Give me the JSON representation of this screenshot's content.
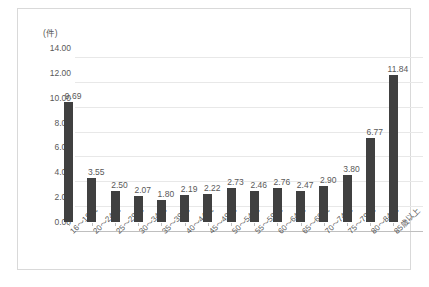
{
  "chart_data": {
    "type": "bar",
    "title": "",
    "subtitle": "",
    "xlabel": "",
    "ylabel": "(件)",
    "unit_label": "(件)",
    "ylim": [
      0,
      14
    ],
    "ytick_step": 2,
    "grid": true,
    "legend": false,
    "bar_color": "#404040",
    "categories": [
      "16～19歳",
      "20～24歳",
      "25～29歳",
      "30～34歳",
      "35～39歳",
      "40～44歳",
      "45～49歳",
      "50～54歳",
      "55～59歳",
      "60～64歳",
      "65～69歳",
      "70～74歳",
      "75～79歳",
      "80～84歳",
      "85歳以上"
    ],
    "values": [
      9.69,
      3.55,
      2.5,
      2.07,
      1.8,
      2.19,
      2.22,
      2.73,
      2.46,
      2.76,
      2.47,
      2.9,
      3.8,
      6.77,
      11.84
    ],
    "value_labels": [
      "9.69",
      "3.55",
      "2.50",
      "2.07",
      "1.80",
      "2.19",
      "2.22",
      "2.73",
      "2.46",
      "2.76",
      "2.47",
      "2.90",
      "3.80",
      "6.77",
      "11.84"
    ],
    "ytick_labels": [
      "14.00",
      "12.00",
      "10.00",
      "8.00",
      "6.00",
      "4.00",
      "2.00",
      "0.00"
    ],
    "ytick_values": [
      14,
      12,
      10,
      8,
      6,
      4,
      2,
      0
    ]
  }
}
